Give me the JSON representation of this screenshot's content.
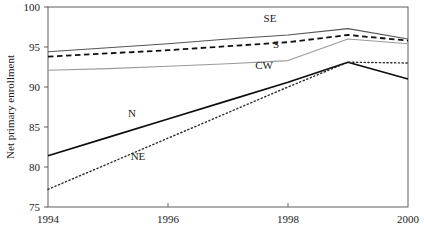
{
  "chart_data": {
    "type": "line",
    "title": "",
    "xlabel": "",
    "ylabel": "Net primary enrollment",
    "x": [
      1994,
      1995,
      1996,
      1997,
      1998,
      1999,
      2000
    ],
    "xlim": [
      1994,
      2000
    ],
    "ylim": [
      75,
      100
    ],
    "xticks": [
      1994,
      1996,
      1998,
      2000
    ],
    "xtick_labels": [
      "1994",
      "1996",
      "1998",
      "2000"
    ],
    "yticks": [
      75,
      80,
      85,
      90,
      95,
      100
    ],
    "ytick_labels": [
      "75",
      "80",
      "85",
      "90",
      "95",
      "100"
    ],
    "grid": false,
    "legend": "inline-labels",
    "series": [
      {
        "name": "SE",
        "label": "SE",
        "style": "solid",
        "color": "#555555",
        "width": 1.1,
        "label_x": 1997.7,
        "label_y": 98.1,
        "values": [
          94.4,
          94.9,
          95.4,
          96.0,
          96.5,
          97.3,
          96.0
        ]
      },
      {
        "name": "S",
        "label": "S",
        "style": "dashed",
        "color": "#111111",
        "width": 1.8,
        "label_x": 1997.8,
        "label_y": 94.9,
        "values": [
          93.8,
          94.2,
          94.6,
          95.1,
          95.6,
          96.5,
          95.8
        ]
      },
      {
        "name": "CW",
        "label": "CW",
        "style": "solid",
        "color": "#9a9a9a",
        "width": 1.1,
        "label_x": 1997.6,
        "label_y": 92.3,
        "values": [
          92.1,
          92.3,
          92.6,
          92.9,
          93.3,
          96.0,
          95.4
        ]
      },
      {
        "name": "N",
        "label": "N",
        "style": "solid",
        "color": "#0d0d0d",
        "width": 1.7,
        "label_x": 1995.4,
        "label_y": 86.3,
        "values": [
          81.4,
          83.7,
          86.0,
          88.3,
          90.6,
          93.1,
          91.0
        ]
      },
      {
        "name": "NE",
        "label": "NE",
        "style": "dotted",
        "color": "#2b2b2b",
        "width": 1.4,
        "label_x": 1995.5,
        "label_y": 80.9,
        "values": [
          77.2,
          80.4,
          83.6,
          86.8,
          90.0,
          93.1,
          93.0
        ]
      }
    ]
  },
  "axes": {
    "frame_color": "#4d4d4d",
    "background": "#ffffff"
  }
}
